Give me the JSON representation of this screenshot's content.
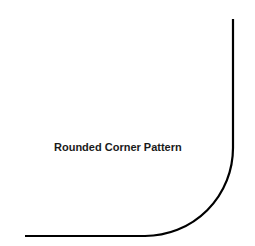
{
  "diagram": {
    "label": "Rounded Corner Pattern",
    "stroke_color": "#000000",
    "background_color": "#ffffff",
    "shape": "rounded-corner",
    "vertical_line": {
      "x": 233,
      "y_start": 19,
      "y_end": 148
    },
    "horizontal_line": {
      "y": 236,
      "x_start": 25,
      "x_end": 145
    },
    "corner_radius": 88
  }
}
